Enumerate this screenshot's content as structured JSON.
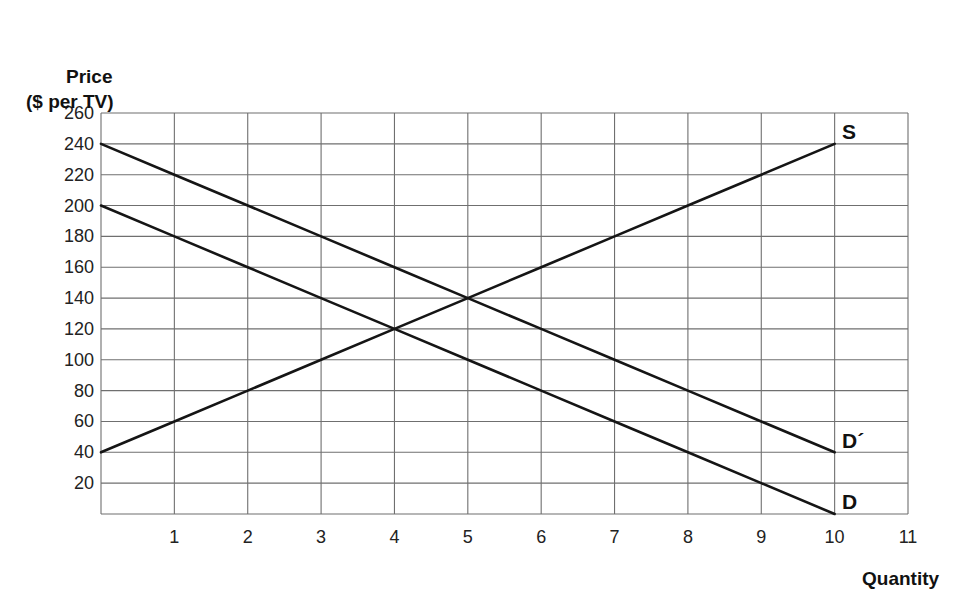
{
  "chart_data": {
    "type": "line",
    "title": "",
    "ylabel": "Price ($ per TV)",
    "ylabel_lines": [
      "Price",
      "($ per TV)"
    ],
    "xlabel": "Quantity",
    "xlim": [
      0,
      11
    ],
    "ylim": [
      0,
      260
    ],
    "x_ticks": [
      1,
      2,
      3,
      4,
      5,
      6,
      7,
      8,
      9,
      10,
      11
    ],
    "y_ticks": [
      20,
      40,
      60,
      80,
      100,
      120,
      140,
      160,
      180,
      200,
      220,
      240,
      260
    ],
    "grid": true,
    "series": [
      {
        "name": "S",
        "label": "S",
        "x": [
          0,
          1,
          2,
          3,
          4,
          5,
          6,
          7,
          8,
          9,
          10
        ],
        "values": [
          40,
          60,
          80,
          100,
          120,
          140,
          160,
          180,
          200,
          220,
          240
        ]
      },
      {
        "name": "D",
        "label": "D",
        "x": [
          0,
          1,
          2,
          3,
          4,
          5,
          6,
          7,
          8,
          9,
          10
        ],
        "values": [
          200,
          180,
          160,
          140,
          120,
          100,
          80,
          60,
          40,
          20,
          0
        ]
      },
      {
        "name": "D′",
        "label": "D´",
        "x": [
          0,
          1,
          2,
          3,
          4,
          5,
          6,
          7,
          8,
          9,
          10
        ],
        "values": [
          240,
          220,
          200,
          180,
          160,
          140,
          120,
          100,
          80,
          60,
          40
        ]
      }
    ],
    "annotations": [
      {
        "text": "S",
        "at": [
          10,
          240
        ]
      },
      {
        "text": "D´",
        "at": [
          10,
          40
        ]
      },
      {
        "text": "D",
        "at": [
          10,
          0
        ]
      }
    ],
    "intersections": [
      {
        "curves": [
          "S",
          "D"
        ],
        "x": 4,
        "y": 120
      },
      {
        "curves": [
          "S",
          "D′"
        ],
        "x": 5,
        "y": 140
      }
    ]
  },
  "labels": {
    "y_line1": "Price",
    "y_line2": "($ per TV)",
    "x_axis": "Quantity",
    "s_curve": "S",
    "d_prime_curve": "D´",
    "d_curve": "D"
  }
}
